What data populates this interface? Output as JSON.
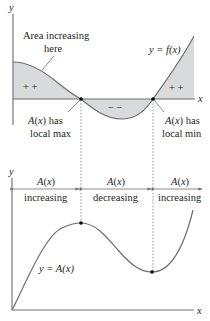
{
  "top_graph": {
    "y_axis_label": "y",
    "x_axis_label": "x",
    "curve_label": "y = f(x)",
    "annotation_area": [
      "Area increasing",
      "here"
    ],
    "positive_signs_left": "+ +",
    "negative_signs": "− −",
    "positive_signs_right": "+ +",
    "local_max_label": [
      "A(x) has",
      "local max"
    ],
    "local_min_label": [
      "A(x) has",
      "local min"
    ]
  },
  "bottom_graph": {
    "y_axis_label": "y",
    "x_axis_label": "x",
    "curve_label": "y = A(x)",
    "intervals": [
      {
        "top": "A(x)",
        "bottom": "increasing"
      },
      {
        "top": "A(x)",
        "bottom": "decreasing"
      },
      {
        "top": "A(x)",
        "bottom": "increasing"
      }
    ]
  },
  "colors": {
    "shade": "#d9dadb",
    "curve": "#6d6e71",
    "text": "#231f20"
  }
}
